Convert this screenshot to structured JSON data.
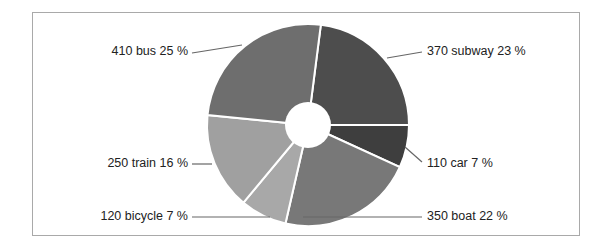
{
  "chart_data": {
    "type": "pie",
    "variant": "donut",
    "title": "",
    "start_angle_deg": 7.3,
    "direction": "clockwise",
    "center": [
      308,
      125
    ],
    "radius": 101,
    "hole_radius": 23,
    "slices": [
      {
        "name": "subway",
        "value": 370,
        "percent": 23,
        "label": "370 subway 23 %",
        "color": "#4d4d4d",
        "label_pos": [
          427,
          52
        ],
        "anchor": "start",
        "leader": [
          [
            387,
            58
          ],
          [
            422,
            52
          ]
        ]
      },
      {
        "name": "car",
        "value": 110,
        "percent": 7,
        "label": "110 car 7 %",
        "color": "#3e3e3e",
        "label_pos": [
          427,
          164
        ],
        "anchor": "start",
        "leader": [
          [
            405,
            147
          ],
          [
            422,
            162
          ]
        ]
      },
      {
        "name": "boat",
        "value": 350,
        "percent": 22,
        "label": "350 boat 22 %",
        "color": "#787878",
        "label_pos": [
          427,
          217
        ],
        "anchor": "start",
        "leader": [
          [
            303,
            217
          ],
          [
            422,
            217
          ]
        ]
      },
      {
        "name": "bicycle",
        "value": 120,
        "percent": 7,
        "label": "120 bicycle 7 %",
        "color": "#a8a8a8",
        "label_pos": [
          188,
          217
        ],
        "anchor": "end",
        "leader": [
          [
            192,
            217
          ],
          [
            270,
            217
          ]
        ]
      },
      {
        "name": "train",
        "value": 250,
        "percent": 16,
        "label": "250 train 16 %",
        "color": "#a0a0a0",
        "label_pos": [
          188,
          164
        ],
        "anchor": "end",
        "leader": [
          [
            192,
            164
          ],
          [
            212,
            164
          ]
        ]
      },
      {
        "name": "bus",
        "value": 410,
        "percent": 25,
        "label": "410 bus 25 %",
        "color": "#6e6e6e",
        "label_pos": [
          188,
          52
        ],
        "anchor": "end",
        "leader": [
          [
            192,
            53
          ],
          [
            242,
            45
          ]
        ]
      }
    ],
    "total": 1610,
    "legend": "none",
    "separator_color": "#ffffff",
    "leader_color": "#666666"
  }
}
